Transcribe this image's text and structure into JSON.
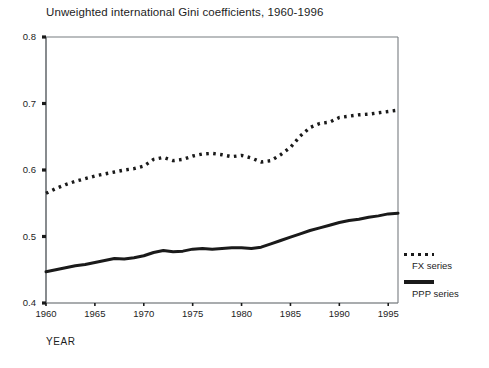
{
  "chart_data": {
    "type": "line",
    "title": "Unweighted international Gini coefficients, 1960-1996",
    "xlabel": "YEAR",
    "ylabel": "",
    "xlim": [
      1960,
      1996
    ],
    "ylim": [
      0.4,
      0.8
    ],
    "grid": false,
    "legend_position": "right",
    "x_ticks": [
      "1960",
      "1965",
      "1970",
      "1975",
      "1980",
      "1985",
      "1990",
      "1995"
    ],
    "y_ticks": [
      "0.4",
      "0.5",
      "0.6",
      "0.7",
      "0.8"
    ],
    "x": [
      1960,
      1961,
      1962,
      1963,
      1964,
      1965,
      1966,
      1967,
      1968,
      1969,
      1970,
      1971,
      1972,
      1973,
      1974,
      1975,
      1976,
      1977,
      1978,
      1979,
      1980,
      1981,
      1982,
      1983,
      1984,
      1985,
      1986,
      1987,
      1988,
      1989,
      1990,
      1991,
      1992,
      1993,
      1994,
      1995,
      1996
    ],
    "series": [
      {
        "name": "FX series",
        "style": "dotted",
        "color": "#1a1a1a",
        "values": [
          0.565,
          0.572,
          0.578,
          0.583,
          0.587,
          0.591,
          0.594,
          0.597,
          0.6,
          0.602,
          0.606,
          0.616,
          0.619,
          0.614,
          0.616,
          0.621,
          0.624,
          0.625,
          0.623,
          0.62,
          0.622,
          0.618,
          0.612,
          0.614,
          0.623,
          0.634,
          0.651,
          0.664,
          0.67,
          0.672,
          0.679,
          0.681,
          0.683,
          0.684,
          0.686,
          0.688,
          0.69
        ]
      },
      {
        "name": "PPP series",
        "style": "solid",
        "color": "#1a1a1a",
        "values": [
          0.447,
          0.45,
          0.453,
          0.456,
          0.458,
          0.461,
          0.464,
          0.467,
          0.466,
          0.468,
          0.471,
          0.476,
          0.479,
          0.477,
          0.478,
          0.481,
          0.482,
          0.481,
          0.482,
          0.483,
          0.483,
          0.482,
          0.484,
          0.489,
          0.494,
          0.499,
          0.504,
          0.509,
          0.513,
          0.517,
          0.521,
          0.524,
          0.526,
          0.529,
          0.531,
          0.534,
          0.535
        ]
      }
    ]
  },
  "legend": {
    "entries": [
      {
        "label": "FX series"
      },
      {
        "label": "PPP series"
      }
    ]
  }
}
